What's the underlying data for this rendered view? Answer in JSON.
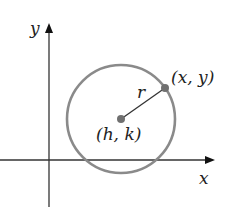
{
  "diagram": {
    "axes": {
      "x_label": "x",
      "y_label": "y"
    },
    "circle": {
      "center_label": "(h, k)",
      "point_label": "(x, y)",
      "radius_label": "r"
    },
    "colors": {
      "axis": "#333333",
      "circle": "#8a8a8a",
      "points": "#707070",
      "radius": "#333333"
    }
  }
}
